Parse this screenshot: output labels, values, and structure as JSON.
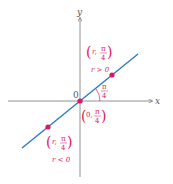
{
  "diagram": {
    "type": "polar-line",
    "axes": {
      "x_label": "x",
      "y_label": "y",
      "origin_label": "0"
    },
    "line": {
      "equation": "θ = π/4",
      "color": "#2b7bc0"
    },
    "points": [
      {
        "id": "upper",
        "label_top": "(r, π/4)",
        "condition": "r > 0",
        "color": "#d81b60"
      },
      {
        "id": "origin",
        "label": "(0, π/4)",
        "color": "#d81b60"
      },
      {
        "id": "lower",
        "label_top": "(r, π/4)",
        "condition": "r < 0",
        "color": "#d81b60"
      }
    ],
    "angle_label": "π/4",
    "labels": {
      "upper_r": "r,",
      "upper_frac_num": "π",
      "upper_frac_den": "4",
      "upper_cond": "r > 0",
      "origin_r": "0,",
      "origin_frac_num": "π",
      "origin_frac_den": "4",
      "lower_r": "r,",
      "lower_frac_num": "π",
      "lower_frac_den": "4",
      "lower_cond": "r < 0",
      "angle_num": "π",
      "angle_den": "4"
    }
  }
}
